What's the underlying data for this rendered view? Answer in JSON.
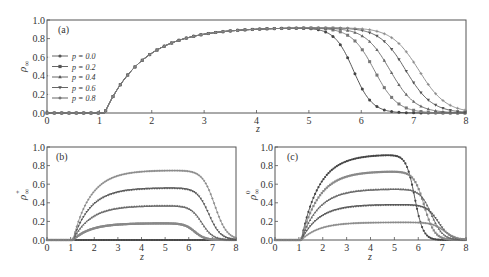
{
  "chart_data": [
    {
      "id": "a",
      "type": "line",
      "panel_label": "(a)",
      "xlabel": "z",
      "ylabel": "ρ∞",
      "xlim": [
        0,
        8
      ],
      "ylim": [
        0,
        1.0
      ],
      "xticks": [
        "0",
        "1",
        "2",
        "3",
        "4",
        "5",
        "6",
        "7",
        "8"
      ],
      "yticks": [
        "0.0",
        "0.2",
        "0.4",
        "0.6",
        "0.8",
        "1.0"
      ],
      "grid": false,
      "legend_position": "center-left",
      "legend": [
        "p=0.0",
        "p=0.2",
        "p=0.4",
        "p=0.6",
        "p=0.8"
      ],
      "series": [
        {
          "name": "p=0.0",
          "marker": "circle",
          "color": "#444444",
          "peak": 0.92,
          "onset": 1.1,
          "decay_mid": 5.85,
          "decay_width": 0.18
        },
        {
          "name": "p=0.2",
          "marker": "square",
          "color": "#777777",
          "peak": 0.92,
          "onset": 1.1,
          "decay_mid": 6.25,
          "decay_width": 0.22
        },
        {
          "name": "p=0.4",
          "marker": "triangle-up",
          "color": "#666666",
          "peak": 0.92,
          "onset": 1.1,
          "decay_mid": 6.55,
          "decay_width": 0.24
        },
        {
          "name": "p=0.6",
          "marker": "triangle-down",
          "color": "#555555",
          "peak": 0.92,
          "onset": 1.1,
          "decay_mid": 6.85,
          "decay_width": 0.25
        },
        {
          "name": "p=0.8",
          "marker": "plus",
          "color": "#888888",
          "peak": 0.92,
          "onset": 1.1,
          "decay_mid": 7.1,
          "decay_width": 0.26
        }
      ]
    },
    {
      "id": "b",
      "type": "line",
      "panel_label": "(b)",
      "xlabel": "z",
      "ylabel": "ρ∞+",
      "xlim": [
        0,
        8
      ],
      "ylim": [
        0,
        1.0
      ],
      "xticks": [
        "0",
        "1",
        "2",
        "3",
        "4",
        "5",
        "6",
        "7",
        "8"
      ],
      "yticks": [
        "0.0",
        "0.2",
        "0.4",
        "0.6",
        "0.8",
        "1.0"
      ],
      "grid": false,
      "series": [
        {
          "name": "p=0.0",
          "marker": "circle",
          "color": "#444444",
          "peak": 0.0,
          "onset": 1.1,
          "decay_mid": 5.85,
          "decay_width": 0.18
        },
        {
          "name": "p=0.2",
          "marker": "square",
          "color": "#888888",
          "peak": 0.18,
          "onset": 1.1,
          "decay_mid": 6.25,
          "decay_width": 0.22
        },
        {
          "name": "p=0.4",
          "marker": "triangle-up",
          "color": "#666666",
          "peak": 0.37,
          "onset": 1.1,
          "decay_mid": 6.55,
          "decay_width": 0.24
        },
        {
          "name": "p=0.6",
          "marker": "triangle-down",
          "color": "#555555",
          "peak": 0.56,
          "onset": 1.1,
          "decay_mid": 6.85,
          "decay_width": 0.25
        },
        {
          "name": "p=0.8",
          "marker": "plus",
          "color": "#888888",
          "peak": 0.75,
          "onset": 1.1,
          "decay_mid": 7.1,
          "decay_width": 0.26
        }
      ]
    },
    {
      "id": "c",
      "type": "line",
      "panel_label": "(c)",
      "xlabel": "z",
      "ylabel": "ρ∞0",
      "xlim": [
        0,
        8
      ],
      "ylim": [
        0,
        1.0
      ],
      "xticks": [
        "0",
        "1",
        "2",
        "3",
        "4",
        "5",
        "6",
        "7",
        "8"
      ],
      "yticks": [
        "0.0",
        "0.2",
        "0.4",
        "0.6",
        "0.8",
        "1.0"
      ],
      "grid": false,
      "series": [
        {
          "name": "p=0.0",
          "marker": "circle",
          "color": "#444444",
          "peak": 0.92,
          "onset": 1.1,
          "decay_mid": 5.85,
          "decay_width": 0.18
        },
        {
          "name": "p=0.2",
          "marker": "square",
          "color": "#888888",
          "peak": 0.74,
          "onset": 1.1,
          "decay_mid": 6.25,
          "decay_width": 0.22
        },
        {
          "name": "p=0.4",
          "marker": "triangle-up",
          "color": "#666666",
          "peak": 0.55,
          "onset": 1.1,
          "decay_mid": 6.55,
          "decay_width": 0.24
        },
        {
          "name": "p=0.6",
          "marker": "triangle-down",
          "color": "#555555",
          "peak": 0.38,
          "onset": 1.1,
          "decay_mid": 6.85,
          "decay_width": 0.25
        },
        {
          "name": "p=0.8",
          "marker": "plus",
          "color": "#888888",
          "peak": 0.19,
          "onset": 1.1,
          "decay_mid": 7.1,
          "decay_width": 0.26
        }
      ]
    }
  ],
  "panels": {
    "a": {
      "label": "(a)",
      "xlabel": "z",
      "ylabel_main": "ρ",
      "ylabel_sub": "∞",
      "ylabel_sup": ""
    },
    "b": {
      "label": "(b)",
      "xlabel": "z",
      "ylabel_main": "ρ",
      "ylabel_sub": "∞",
      "ylabel_sup": "+"
    },
    "c": {
      "label": "(c)",
      "xlabel": "z",
      "ylabel_main": "ρ",
      "ylabel_sub": "∞",
      "ylabel_sup": "0"
    }
  },
  "legend": {
    "items": [
      {
        "label": "p = 0.0",
        "marker": "circle"
      },
      {
        "label": "p = 0.2",
        "marker": "square"
      },
      {
        "label": "p = 0.4",
        "marker": "triangle-up"
      },
      {
        "label": "p = 0.6",
        "marker": "triangle-down"
      },
      {
        "label": "p = 0.8",
        "marker": "plus"
      }
    ]
  }
}
